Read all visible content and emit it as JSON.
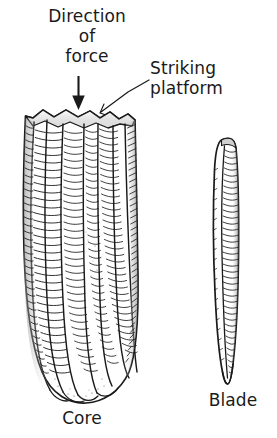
{
  "figure": {
    "background_color": "#ffffff",
    "ink_color": "#1a1a1a",
    "width": 277,
    "height": 438
  },
  "annotations": {
    "direction_of_force": {
      "line1": "Direction",
      "line2": "of",
      "line3": "force",
      "full_text": "Direction of force",
      "pointer": "downward-arrow"
    },
    "striking_platform": {
      "line1": "Striking",
      "line2": "platform",
      "full_text": "Striking platform",
      "pointer": "leader-line"
    }
  },
  "captions": {
    "core": "Core",
    "blade": "Blade"
  },
  "objects": [
    {
      "name": "core",
      "caption": "Core",
      "description": "Conical prismatic blade core with multiple parallel blade-removal flute scars and hachure shading",
      "flute_count": 5
    },
    {
      "name": "blade",
      "caption": "Blade",
      "description": "Long narrow prismatic blade detached from the core, pointed at the distal end",
      "flute_count": 1
    }
  ],
  "icons": {
    "force_arrow": "down-arrow-icon",
    "leader": "leader-line-icon"
  }
}
